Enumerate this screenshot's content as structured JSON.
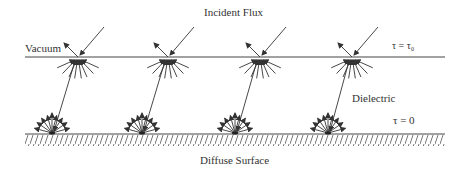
{
  "title": "Incident Flux",
  "labels": {
    "vacuum": "Vacuum",
    "tau_top": "τ = τ₀",
    "dielectric": "Dielectric",
    "tau_bottom": "τ = 0",
    "bottom": "Diffuse Surface"
  },
  "geometry": {
    "interface_y": 57,
    "surface_y": 134,
    "line_x_start": 25,
    "line_x_end": 445,
    "top_points_x": [
      78,
      168,
      260,
      352
    ],
    "bottom_points_x": [
      52,
      142,
      235,
      328
    ]
  },
  "colors": {
    "ink": "#333333"
  }
}
